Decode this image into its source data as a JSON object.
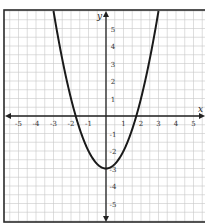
{
  "chart_data": {
    "type": "line",
    "title": "",
    "xlabel": "x",
    "ylabel": "y",
    "function": "y = x^2 - 3",
    "x_ticks": [
      "-5",
      "-4",
      "-3",
      "-2",
      "-1",
      "1",
      "2",
      "3",
      "4",
      "5"
    ],
    "y_ticks": [
      "5",
      "4",
      "3",
      "2",
      "1",
      "-1",
      "-2",
      "-3",
      "-4",
      "-5"
    ],
    "xlim": [
      -5.8,
      5.6
    ],
    "ylim": [
      -6,
      6.1
    ],
    "grid": true,
    "grid_minor_step": 0.5,
    "series": [
      {
        "name": "parabola",
        "x": [
          -3,
          -2.5,
          -2,
          -1.732,
          -1.5,
          -1,
          -0.5,
          0,
          0.5,
          1,
          1.5,
          1.732,
          2,
          2.5,
          3
        ],
        "y": [
          6,
          3.25,
          1,
          0,
          -0.75,
          -2,
          -2.75,
          -3,
          -2.75,
          -2,
          -0.75,
          0,
          1,
          3.25,
          6
        ]
      }
    ],
    "vertex": [
      0,
      -3
    ],
    "x_intercepts": [
      -1.73,
      1.73
    ]
  },
  "colors": {
    "grid": "#c8c8c8",
    "axis": "#222222",
    "curve": "#1a1a1a"
  }
}
